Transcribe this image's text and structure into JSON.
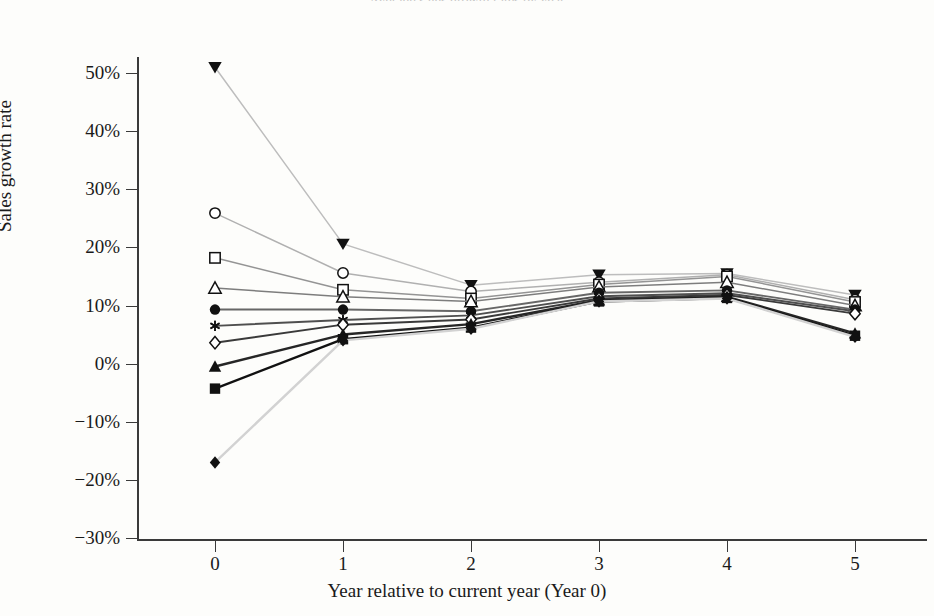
{
  "figure": {
    "partial_title": "Average sales growth rates by year",
    "background": "#fdfdfb",
    "axis_color": "#3a3a3a"
  },
  "axes": {
    "ylabel": "Sales growth rate",
    "xlabel": "Year relative to current year (Year 0)",
    "yticks": [
      "50%",
      "40%",
      "30%",
      "20%",
      "10%",
      "0%",
      "-10%",
      "-20%",
      "-30%"
    ],
    "ytick_values": [
      50,
      40,
      30,
      20,
      10,
      0,
      -10,
      -20,
      -30
    ],
    "xticks": [
      "0",
      "1",
      "2",
      "3",
      "4",
      "5"
    ],
    "xtick_values": [
      0,
      1,
      2,
      3,
      4,
      5
    ]
  },
  "chart_data": {
    "type": "line",
    "title": "Average sales growth rates by year",
    "xlabel": "Year relative to current year (Year 0)",
    "ylabel": "Sales growth rate",
    "x": [
      0,
      1,
      2,
      3,
      4,
      5
    ],
    "xlim": [
      -0.42,
      5.4
    ],
    "ylim": [
      -30,
      54
    ],
    "grid": false,
    "legend": "none",
    "units": "percent",
    "series": [
      {
        "name": "Decile 1 (highest growth)",
        "marker": "triangle-down-filled",
        "color": "#bdbdbd",
        "values": [
          51.0,
          20.6,
          13.5,
          15.3,
          15.5,
          11.8
        ]
      },
      {
        "name": "Decile 2",
        "marker": "circle-open",
        "color": "#b0b0b0",
        "values": [
          25.9,
          15.6,
          12.4,
          14.0,
          15.3,
          11.0
        ]
      },
      {
        "name": "Decile 3",
        "marker": "square-open",
        "color": "#949494",
        "values": [
          18.2,
          12.7,
          11.2,
          13.6,
          15.0,
          10.6
        ]
      },
      {
        "name": "Decile 4",
        "marker": "triangle-up-open",
        "color": "#7d7d7d",
        "values": [
          13.0,
          11.5,
          10.7,
          13.2,
          14.0,
          10.0
        ]
      },
      {
        "name": "Decile 5",
        "marker": "circle-filled",
        "color": "#676767",
        "values": [
          9.3,
          9.3,
          9.0,
          12.2,
          12.6,
          9.3
        ]
      },
      {
        "name": "Decile 6",
        "marker": "asterisk",
        "color": "#4f4f4f",
        "values": [
          6.5,
          7.5,
          8.3,
          11.6,
          12.1,
          9.0
        ]
      },
      {
        "name": "Decile 7",
        "marker": "diamond-open",
        "color": "#3a3a3a",
        "values": [
          3.6,
          6.7,
          7.6,
          11.2,
          11.8,
          8.6
        ]
      },
      {
        "name": "Decile 8",
        "marker": "triangle-up-filled",
        "color": "#262626",
        "values": [
          -0.5,
          5.0,
          6.8,
          10.9,
          11.5,
          5.2
        ]
      },
      {
        "name": "Decile 9",
        "marker": "square-filled",
        "color": "#111111",
        "values": [
          -4.3,
          4.2,
          6.2,
          10.7,
          11.3,
          4.8
        ]
      },
      {
        "name": "Decile 10 (lowest growth)",
        "marker": "diamond-filled",
        "color": "#d2d2d2",
        "values": [
          -17.0,
          4.0,
          6.0,
          10.7,
          11.2,
          4.6
        ]
      }
    ]
  }
}
